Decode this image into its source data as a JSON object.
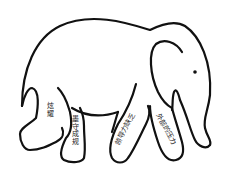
{
  "diagram": {
    "stroke_color": "#111111",
    "background": "#ffffff",
    "legs": [
      {
        "id": "hind-left",
        "label": "炫耀"
      },
      {
        "id": "hind-right",
        "label": "墨守成规"
      },
      {
        "id": "front-left",
        "label": "领导力缺乏"
      },
      {
        "id": "front-right",
        "label": "外部的压力"
      }
    ]
  }
}
